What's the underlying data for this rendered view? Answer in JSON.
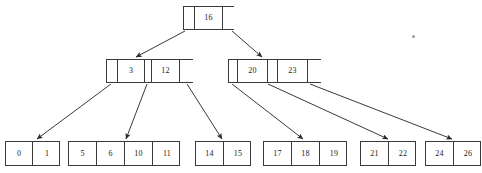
{
  "diagram": {
    "type": "b-tree",
    "background_color": "#ffffff",
    "line_color": "#3a3a3a",
    "text_color": "#1a1a1a",
    "nodes": [
      {
        "id": "root",
        "level": "root",
        "x": 183,
        "y": 6,
        "width": 51,
        "height": 24,
        "cells": [
          {
            "type": "pointer",
            "label": ""
          },
          {
            "type": "key",
            "label": "16"
          },
          {
            "type": "pointer",
            "label": ""
          }
        ],
        "cell_widths": [
          11,
          28,
          12
        ]
      },
      {
        "id": "internal-left",
        "level": "internal",
        "x": 106,
        "y": 59,
        "width": 87,
        "height": 24,
        "cells": [
          {
            "type": "pointer",
            "label": ""
          },
          {
            "type": "key",
            "label": "3"
          },
          {
            "type": "pointer",
            "label": ""
          },
          {
            "type": "key",
            "label": "12"
          },
          {
            "type": "pointer",
            "label": ""
          }
        ],
        "cell_widths": [
          11,
          27,
          7,
          28,
          14
        ]
      },
      {
        "id": "internal-right",
        "level": "internal",
        "x": 228,
        "y": 59,
        "width": 93,
        "height": 24,
        "cells": [
          {
            "type": "pointer",
            "label": ""
          },
          {
            "type": "key",
            "label": "20"
          },
          {
            "type": "pointer",
            "label": ""
          },
          {
            "type": "key",
            "label": "23"
          },
          {
            "type": "pointer",
            "label": ""
          }
        ],
        "cell_widths": [
          9,
          30,
          10,
          30,
          14
        ]
      },
      {
        "id": "leaf-1",
        "level": "leaf",
        "x": 5,
        "y": 141,
        "width": 55,
        "height": 25,
        "cells": [
          {
            "type": "key",
            "label": "0"
          },
          {
            "type": "key",
            "label": "1"
          }
        ],
        "cell_widths": [
          27,
          28
        ]
      },
      {
        "id": "leaf-2",
        "level": "leaf",
        "x": 68,
        "y": 141,
        "width": 112,
        "height": 25,
        "cells": [
          {
            "type": "key",
            "label": "5"
          },
          {
            "type": "key",
            "label": "6"
          },
          {
            "type": "key",
            "label": "10"
          },
          {
            "type": "key",
            "label": "11"
          }
        ],
        "cell_widths": [
          28,
          28,
          28,
          28
        ]
      },
      {
        "id": "leaf-3",
        "level": "leaf",
        "x": 195,
        "y": 141,
        "width": 56,
        "height": 25,
        "cells": [
          {
            "type": "key",
            "label": "14"
          },
          {
            "type": "key",
            "label": "15"
          }
        ],
        "cell_widths": [
          28,
          28
        ]
      },
      {
        "id": "leaf-4",
        "level": "leaf",
        "x": 263,
        "y": 141,
        "width": 84,
        "height": 25,
        "cells": [
          {
            "type": "key",
            "label": "17"
          },
          {
            "type": "key",
            "label": "18"
          },
          {
            "type": "key",
            "label": "19"
          }
        ],
        "cell_widths": [
          28,
          28,
          28
        ]
      },
      {
        "id": "leaf-5",
        "level": "leaf",
        "x": 360,
        "y": 141,
        "width": 56,
        "height": 25,
        "cells": [
          {
            "type": "key",
            "label": "21"
          },
          {
            "type": "key",
            "label": "22"
          }
        ],
        "cell_widths": [
          28,
          28
        ]
      },
      {
        "id": "leaf-6",
        "level": "leaf",
        "x": 425,
        "y": 141,
        "width": 56,
        "height": 25,
        "cells": [
          {
            "type": "key",
            "label": "24"
          },
          {
            "type": "key",
            "label": "26"
          }
        ],
        "cell_widths": [
          28,
          28
        ]
      }
    ],
    "edges": [
      {
        "id": "root-to-left",
        "from": "root",
        "to": "internal-left",
        "x1": 185,
        "y1": 31,
        "x2": 136,
        "y2": 57
      },
      {
        "id": "root-to-right",
        "from": "root",
        "to": "internal-right",
        "x1": 232,
        "y1": 31,
        "x2": 262,
        "y2": 57
      },
      {
        "id": "left-to-leaf1",
        "from": "internal-left",
        "to": "leaf-1",
        "x1": 111,
        "y1": 84,
        "x2": 37,
        "y2": 139
      },
      {
        "id": "left-to-leaf2",
        "from": "internal-left",
        "to": "leaf-2",
        "x1": 147,
        "y1": 84,
        "x2": 126,
        "y2": 139
      },
      {
        "id": "left-to-leaf3",
        "from": "internal-left",
        "to": "leaf-3",
        "x1": 187,
        "y1": 84,
        "x2": 222,
        "y2": 139
      },
      {
        "id": "right-to-leaf4",
        "from": "internal-right",
        "to": "leaf-4",
        "x1": 232,
        "y1": 84,
        "x2": 303,
        "y2": 139
      },
      {
        "id": "right-to-leaf5",
        "from": "internal-right",
        "to": "leaf-5",
        "x1": 268,
        "y1": 84,
        "x2": 388,
        "y2": 139
      },
      {
        "id": "right-to-leaf6",
        "from": "internal-right",
        "to": "leaf-6",
        "x1": 310,
        "y1": 84,
        "x2": 452,
        "y2": 139
      }
    ],
    "artifacts": [
      {
        "id": "speck",
        "x": 412,
        "y": 35
      }
    ]
  }
}
